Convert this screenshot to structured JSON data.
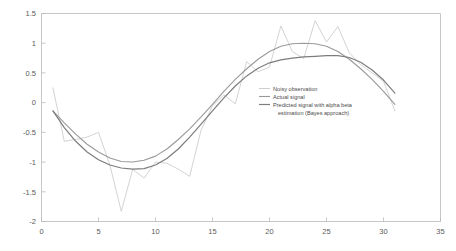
{
  "chart_data": {
    "type": "line",
    "title": "",
    "xlabel": "",
    "ylabel": "",
    "xlim": [
      0,
      35
    ],
    "ylim": [
      -2,
      1.5
    ],
    "xticks": [
      0,
      5,
      10,
      15,
      20,
      25,
      30,
      35
    ],
    "yticks": [
      1.5,
      1,
      0.5,
      0,
      -0.5,
      -1,
      -1.5,
      -2
    ],
    "xtick_labels": [
      "0",
      "5",
      "10",
      "15",
      "20",
      "25",
      "30",
      "35"
    ],
    "ytick_labels": [
      "1.5",
      "1",
      "0.5",
      "0",
      "-0.5",
      "-1",
      "-1.5",
      "-2"
    ],
    "grid": false,
    "legend_position": "center-right",
    "x": [
      1,
      2,
      3,
      4,
      5,
      6,
      7,
      8,
      9,
      10,
      11,
      12,
      13,
      14,
      15,
      16,
      17,
      18,
      19,
      20,
      21,
      22,
      23,
      24,
      25,
      26,
      27,
      28,
      29,
      30,
      31
    ],
    "series": [
      {
        "name": "Noisy observation",
        "color": "#c8c8c8",
        "width": 0.8,
        "values": [
          0.25,
          -0.65,
          -0.62,
          -0.58,
          -0.5,
          -1.05,
          -1.83,
          -1.12,
          -1.27,
          -1.0,
          -1.02,
          -1.12,
          -1.24,
          -0.46,
          -0.05,
          0.13,
          -0.02,
          0.69,
          0.52,
          0.6,
          1.29,
          0.86,
          0.74,
          1.38,
          1.02,
          1.28,
          0.84,
          0.64,
          0.5,
          0.36,
          -0.14
        ]
      },
      {
        "name": "Actual signal",
        "color": "#9a9a9a",
        "width": 1.1,
        "values": [
          -0.14,
          -0.34,
          -0.53,
          -0.7,
          -0.83,
          -0.93,
          -0.99,
          -1.0,
          -0.97,
          -0.9,
          -0.78,
          -0.62,
          -0.44,
          -0.24,
          -0.03,
          0.19,
          0.39,
          0.57,
          0.73,
          0.86,
          0.95,
          0.99,
          1.0,
          0.99,
          0.95,
          0.86,
          0.73,
          0.57,
          0.39,
          0.19,
          -0.03
        ]
      },
      {
        "name": "Predicted signal with alpha beta estimation (Bayes approach)",
        "color": "#7d7d7d",
        "width": 1.2,
        "values": [
          -0.14,
          -0.42,
          -0.65,
          -0.83,
          -0.96,
          -1.05,
          -1.1,
          -1.12,
          -1.11,
          -1.05,
          -0.94,
          -0.78,
          -0.58,
          -0.36,
          -0.14,
          0.08,
          0.28,
          0.45,
          0.58,
          0.67,
          0.72,
          0.75,
          0.77,
          0.78,
          0.79,
          0.79,
          0.76,
          0.68,
          0.55,
          0.38,
          0.16
        ]
      }
    ]
  },
  "legend": {
    "entries": [
      {
        "label": "Noisy observation",
        "color": "#c8c8c8"
      },
      {
        "label": "Actual signal",
        "color": "#9a9a9a"
      },
      {
        "label": "Predicted signal with alpha beta",
        "color": "#7d7d7d"
      },
      {
        "label": "estimation (Bayes approach)",
        "color": ""
      }
    ]
  },
  "axes": {
    "frame_color": "#b9b9b9"
  }
}
